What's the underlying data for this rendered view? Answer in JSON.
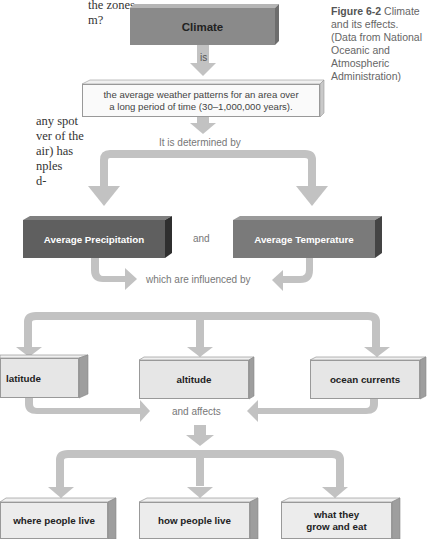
{
  "margin_text": {
    "lines": [
      "the zones,",
      "m?",
      "",
      "",
      "",
      "any spot",
      "ver of the",
      "air) has",
      "nples",
      "d-"
    ]
  },
  "caption": {
    "figure_label": "Figure 6-2",
    "lines": [
      "Climate",
      "and its effects.",
      "(Data from National",
      "Oceanic and",
      "Atmospheric",
      "Administration)"
    ]
  },
  "diagram": {
    "root": "Climate",
    "connector_is": "is",
    "definition_line1": "the average weather patterns for an area over",
    "definition_line2": "a long period of time (30–1,000,000 years).",
    "connector_determined": "It is determined by",
    "factor_left": "Average Precipitation",
    "factor_and": "and",
    "factor_right": "Average Temperature",
    "connector_influenced": "which are influenced by",
    "influences": [
      "latitude",
      "altitude",
      "ocean currents"
    ],
    "connector_affects": "and affects",
    "effects": [
      "where people live",
      "how people live",
      "what they grow and eat"
    ],
    "effect3_line1": "what they",
    "effect3_line2": "grow and eat"
  },
  "colors": {
    "dark_box": "#5f5f5f",
    "mid_box": "#8a8a8a",
    "light_box": "#e6e6e6",
    "arrow": "#c2c2c2"
  }
}
